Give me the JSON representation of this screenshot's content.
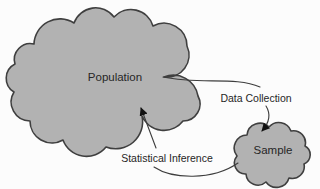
{
  "figure": {
    "type": "diagram",
    "nodes": {
      "population": {
        "label": "Population"
      },
      "sample": {
        "label": "Sample"
      }
    },
    "edges": {
      "data_collection": {
        "label": "Data Collection",
        "from": "population",
        "to": "sample"
      },
      "statistical_inference": {
        "label": "Statistical Inference",
        "from": "sample",
        "to": "population"
      }
    },
    "colors": {
      "cloud_fill": "#b2b2b2",
      "cloud_stroke": "#3f3f3f",
      "connector": "#3d3d3d",
      "arrowhead": "#111111",
      "label_text": "#262626",
      "background": "#fcfcfc"
    }
  }
}
